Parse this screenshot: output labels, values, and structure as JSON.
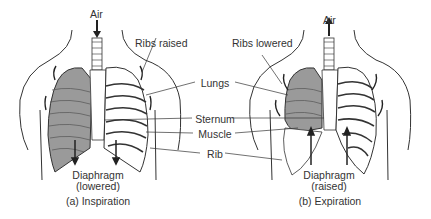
{
  "diagram": {
    "panels": [
      {
        "id": "inspiration",
        "caption": "(a) Inspiration",
        "air_label": "Air",
        "air_direction": "in",
        "ribs_label": "Ribs raised",
        "diaphragm_label": "Diaphragm",
        "diaphragm_state": "(lowered)"
      },
      {
        "id": "expiration",
        "caption": "(b) Expiration",
        "air_label": "Air",
        "air_direction": "out",
        "ribs_label": "Ribs lowered",
        "diaphragm_label": "Diaphragm",
        "diaphragm_state": "(raised)"
      }
    ],
    "shared_labels": {
      "lungs": "Lungs",
      "sternum": "Sternum",
      "muscle": "Muscle",
      "rib": "Rib"
    },
    "colors": {
      "lung_fill": "#9a9a9a",
      "line": "#333333",
      "background": "#ffffff"
    }
  }
}
